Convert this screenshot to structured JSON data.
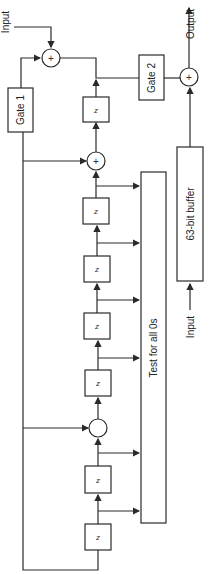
{
  "diagram": {
    "labels": {
      "input_top": "Input",
      "output": "Output",
      "gate1": "Gate 1",
      "gate2": "Gate 2",
      "buffer": "63-bit buffer",
      "test": "Test for all 0s",
      "input_bottom": "Input",
      "delay": "z",
      "plus": "+"
    },
    "delay_count": 7,
    "colors": {
      "line": "#2a2a2a",
      "background": "#ffffff"
    }
  }
}
